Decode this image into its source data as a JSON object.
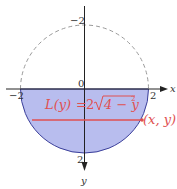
{
  "diagram": {
    "title": "",
    "colors": {
      "fill": "#b8bdee",
      "outline": "#3b3f9a",
      "dashed": "#999999",
      "axis": "#222222",
      "highlight": "#e05050"
    },
    "axes": {
      "x_label": "x",
      "y_label": "y",
      "origin_label": "0",
      "tick_left": "−2",
      "tick_right": "2",
      "tick_top": "−2",
      "tick_bottom": "2"
    },
    "formula": {
      "lhs": "L(y)",
      "eq": "=",
      "coef": "2",
      "radicand": "4 − y",
      "exponent": "2"
    },
    "point_label": "(x, y)",
    "shapes": {
      "circle": "x^2 + y^2 = 4",
      "shaded_region": "lower half-disk (y >= 0, y-axis pointing down)"
    }
  }
}
